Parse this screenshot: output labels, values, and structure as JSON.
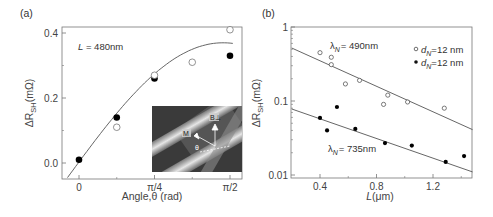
{
  "chart_data": [
    {
      "panel": "(a)",
      "type": "scatter",
      "title": "",
      "xlabel": "Angle,θ (rad)",
      "ylabel": "ΔR_SH(mΩ)",
      "ylabel_main": "ΔR",
      "ylabel_sub": "SH",
      "ylabel_unit": "(mΩ)",
      "xlim": [
        -0.15,
        1.75
      ],
      "ylim": [
        -0.05,
        0.42
      ],
      "x_ticks": [
        {
          "value": 0,
          "label": "0"
        },
        {
          "value": 0.7854,
          "label": "π/4"
        },
        {
          "value": 1.5708,
          "label": "π/2"
        }
      ],
      "y_ticks": [
        {
          "value": 0.0,
          "label": "0.0"
        },
        {
          "value": 0.2,
          "label": "0.2"
        },
        {
          "value": 0.4,
          "label": "0.4"
        }
      ],
      "annotation": "L = 480nm",
      "annotation_italic": "L",
      "annotation_rest": " = 480nm",
      "grid": false,
      "series": [
        {
          "name": "filled",
          "marker": "filled-circle",
          "x": [
            0,
            0.3927,
            0.7854,
            1.5708
          ],
          "y": [
            0.01,
            0.14,
            0.26,
            0.33
          ]
        },
        {
          "name": "open",
          "marker": "open-circle",
          "x": [
            0.3927,
            0.7854,
            1.1781,
            1.5708
          ],
          "y": [
            0.11,
            0.27,
            0.31,
            0.41
          ]
        },
        {
          "name": "fit",
          "marker": "line",
          "description": "sin-like fit curve rising from ~-0.05 at x=-0.1 to ~0.37 at π/2"
        }
      ],
      "inset": {
        "description": "grayscale SEM micrograph of crossing nanowires with vector annotations",
        "labels": [
          "B⊥",
          "M",
          "θ"
        ]
      }
    },
    {
      "panel": "(b)",
      "type": "scatter",
      "title": "",
      "xlabel": "L(μm)",
      "xlabel_italic": "L",
      "xlabel_rest": "(μm)",
      "ylabel": "ΔR_SH(mΩ)",
      "ylabel_main": "ΔR",
      "ylabel_sub": "SH",
      "ylabel_unit": "(mΩ)",
      "yscale": "log",
      "xlim": [
        0.2,
        1.48
      ],
      "ylim": [
        0.01,
        1
      ],
      "x_ticks": [
        {
          "value": 0.4,
          "label": "0.4"
        },
        {
          "value": 0.8,
          "label": "0.8"
        },
        {
          "value": 1.2,
          "label": "1.2"
        }
      ],
      "y_ticks": [
        {
          "value": 0.01,
          "label": "0.01"
        },
        {
          "value": 0.1,
          "label": "0.1"
        },
        {
          "value": 1,
          "label": "1"
        }
      ],
      "grid": false,
      "legend": {
        "position": "upper right",
        "entries": [
          {
            "marker": "open-circle",
            "label": "d_N=12 nm",
            "sym": "d",
            "sub": "N",
            "rest": "=12 nm"
          },
          {
            "marker": "filled-circle",
            "label": "d_N=12 nm",
            "sym": "d",
            "sub": "N",
            "rest": "=12 nm"
          }
        ]
      },
      "annotations": [
        {
          "text": "λ_N = 490nm",
          "sym": "λ",
          "sub": "N",
          "rest": "= 490nm"
        },
        {
          "text": "λ_N = 735nm",
          "sym": "λ",
          "sub": "N",
          "rest": "= 735nm"
        }
      ],
      "series": [
        {
          "name": "open (λN=490nm)",
          "marker": "open-circle",
          "x": [
            0.4,
            0.48,
            0.48,
            0.58,
            0.68,
            0.85,
            0.88,
            1.02,
            1.28
          ],
          "y": [
            0.45,
            0.39,
            0.31,
            0.17,
            0.19,
            0.09,
            0.12,
            0.097,
            0.08
          ]
        },
        {
          "name": "filled (λN=735nm)",
          "marker": "filled-circle",
          "x": [
            0.4,
            0.45,
            0.52,
            0.65,
            0.86,
            1.05,
            1.29,
            1.42
          ],
          "y": [
            0.059,
            0.04,
            0.083,
            0.042,
            0.027,
            0.025,
            0.015,
            0.018
          ]
        },
        {
          "name": "fit 490nm",
          "marker": "line",
          "x": [
            0.2,
            1.48
          ],
          "y": [
            0.52,
            0.041
          ]
        },
        {
          "name": "fit 735nm",
          "marker": "line",
          "x": [
            0.2,
            1.48
          ],
          "y": [
            0.078,
            0.011
          ]
        }
      ]
    }
  ]
}
